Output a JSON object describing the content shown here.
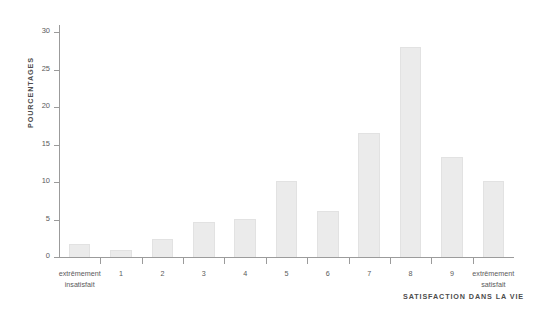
{
  "chart_data": {
    "type": "bar",
    "title": "",
    "subtitle": "",
    "xlabel": "SATISFACTION DANS LA VIE",
    "ylabel": "POURCENTAGES",
    "categories": [
      "extrêmement\ninsatisfait",
      "1",
      "2",
      "3",
      "4",
      "5",
      "6",
      "7",
      "8",
      "9",
      "extrêmement\nsatisfait"
    ],
    "values": [
      1.8,
      0.9,
      2.4,
      4.7,
      5.1,
      10.1,
      6.2,
      16.6,
      28.1,
      13.4,
      10.2
    ],
    "ylim": [
      0,
      31
    ],
    "yticks": [
      0,
      5,
      10,
      15,
      20,
      25,
      30
    ],
    "ytick_labels": [
      "0",
      "5",
      "10",
      "15",
      "20",
      "25",
      "30"
    ],
    "xlim": [
      0,
      11
    ],
    "grid": false,
    "legend": false,
    "bar_color": "#ebebeb",
    "axis_color": "#9b9b9b",
    "text_color": "#4d4d4d"
  }
}
